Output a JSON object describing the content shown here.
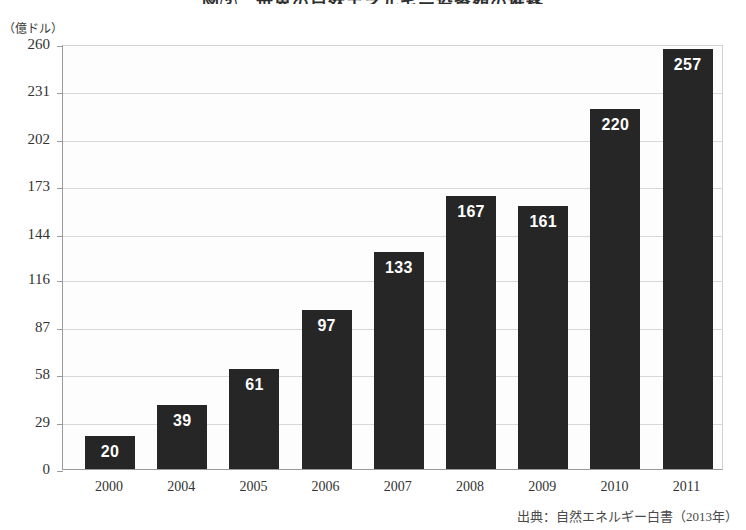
{
  "chart_data": {
    "type": "bar",
    "title": "図③　世界の自然エネルギー投資額の推移",
    "subtitle": "",
    "unit_label": "（億ドル）",
    "xlabel": "",
    "ylabel": "",
    "categories": [
      "2000",
      "2004",
      "2005",
      "2006",
      "2007",
      "2008",
      "2009",
      "2010",
      "2011"
    ],
    "values": [
      20,
      39,
      61,
      97,
      133,
      167,
      161,
      220,
      257
    ],
    "ytick_labels": [
      "0",
      "29",
      "58",
      "87",
      "116",
      "144",
      "173",
      "202",
      "231",
      "260"
    ],
    "ytick_values": [
      0,
      29,
      58,
      87,
      116,
      144,
      173,
      202,
      231,
      260
    ],
    "ylim": [
      0,
      260
    ],
    "grid": true,
    "legend": false,
    "legend_position": "none",
    "bar_color": "#262626",
    "value_label_color": "#ffffff",
    "gridline_color": "#d8d8d8",
    "axis_color": "#9a9a9a",
    "background_color": "#fdfdfd",
    "source": "出典：自然エネルギー白書（2013年）"
  }
}
